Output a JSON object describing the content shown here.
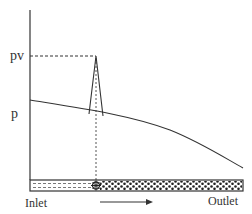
{
  "diagram": {
    "type": "pressure profile along channel (cavitation)",
    "y_axis_labels": {
      "vapor_pressure": "pv",
      "pressure": "p"
    },
    "channel_labels": {
      "inlet": "Inlet",
      "outlet": "Outlet"
    },
    "flow_direction": "left-to-right",
    "elements": [
      "vertical pressure axis",
      "pressure curve decreasing from inlet to outlet",
      "pressure spike reaching pv at bubble collapse location",
      "dashed horizontal line at pv level",
      "dashed vertical line from spike to channel",
      "channel bar: liquid (dashed fill) near inlet, bubbly/porous region toward outlet",
      "collapse star marker at transition",
      "flow arrow"
    ],
    "colors": {
      "line": "#333333",
      "background": "#ffffff"
    }
  }
}
